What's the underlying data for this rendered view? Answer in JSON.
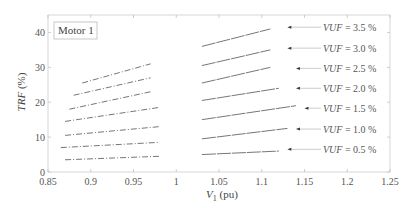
{
  "chart_data": {
    "type": "line",
    "title": "",
    "annotation_box": "Motor 1",
    "xlabel": "V1 (pu)",
    "xlabel_main": "V",
    "xlabel_sub": "1",
    "xlabel_unit": "(pu)",
    "ylabel": "TRF (%)",
    "ylabel_main": "TRF",
    "ylabel_unit": "(%)",
    "xlim": [
      0.85,
      1.25
    ],
    "ylim": [
      0,
      45
    ],
    "xticks": [
      "0.85",
      "0.9",
      "0.95",
      "1",
      "1.05",
      "1.1",
      "1.15",
      "1.2",
      "1.25"
    ],
    "xtick_values": [
      0.85,
      0.9,
      0.95,
      1.0,
      1.05,
      1.1,
      1.15,
      1.2,
      1.25
    ],
    "yticks": [
      "0",
      "10",
      "20",
      "30",
      "40"
    ],
    "ytick_values": [
      0,
      10,
      20,
      30,
      40
    ],
    "grid": false,
    "series": [
      {
        "name": "VUF = 3.5 %",
        "label_prefix": "VUF",
        "label_value": " = 3.5 %",
        "segments": [
          [
            [
              0.89,
              25.5
            ],
            [
              0.97,
              31.0
            ]
          ],
          [
            [
              1.03,
              36.0
            ],
            [
              1.11,
              41.0
            ]
          ]
        ],
        "arrow_x": 1.13,
        "label_y": 41.5
      },
      {
        "name": "VUF = 3.0 %",
        "label_prefix": "VUF",
        "label_value": " = 3.0 %",
        "segments": [
          [
            [
              0.88,
              22.0
            ],
            [
              0.97,
              27.0
            ]
          ],
          [
            [
              1.03,
              30.5
            ],
            [
              1.11,
              35.0
            ]
          ]
        ],
        "arrow_x": 1.13,
        "label_y": 35.5
      },
      {
        "name": "VUF = 2.5 %",
        "label_prefix": "VUF",
        "label_value": " = 2.5 %",
        "segments": [
          [
            [
              0.875,
              18.0
            ],
            [
              0.97,
              23.0
            ]
          ],
          [
            [
              1.03,
              25.5
            ],
            [
              1.11,
              30.0
            ]
          ]
        ],
        "arrow_x": 1.14,
        "label_y": 29.7
      },
      {
        "name": "VUF = 2.0 %",
        "label_prefix": "VUF",
        "label_value": " = 2.0 %",
        "segments": [
          [
            [
              0.87,
              14.5
            ],
            [
              0.98,
              18.5
            ]
          ],
          [
            [
              1.03,
              20.5
            ],
            [
              1.12,
              24.0
            ]
          ]
        ],
        "arrow_x": 1.14,
        "label_y": 24.0
      },
      {
        "name": "VUF = 1.5 %",
        "label_prefix": "VUF",
        "label_value": " = 1.5 %",
        "segments": [
          [
            [
              0.87,
              10.5
            ],
            [
              0.98,
              13.0
            ]
          ],
          [
            [
              1.03,
              15.0
            ],
            [
              1.14,
              19.0
            ]
          ]
        ],
        "arrow_x": 1.15,
        "label_y": 18.3
      },
      {
        "name": "VUF = 1.0 %",
        "label_prefix": "VUF",
        "label_value": " = 1.0 %",
        "segments": [
          [
            [
              0.865,
              7.0
            ],
            [
              0.98,
              8.5
            ]
          ],
          [
            [
              1.03,
              9.5
            ],
            [
              1.13,
              12.5
            ]
          ]
        ],
        "arrow_x": 1.14,
        "label_y": 12.3
      },
      {
        "name": "VUF = 0.5 %",
        "label_prefix": "VUF",
        "label_value": " = 0.5 %",
        "segments": [
          [
            [
              0.87,
              3.5
            ],
            [
              0.98,
              4.5
            ]
          ],
          [
            [
              1.03,
              5.0
            ],
            [
              1.12,
              6.0
            ]
          ]
        ],
        "arrow_x": 1.13,
        "label_y": 6.5
      }
    ]
  }
}
